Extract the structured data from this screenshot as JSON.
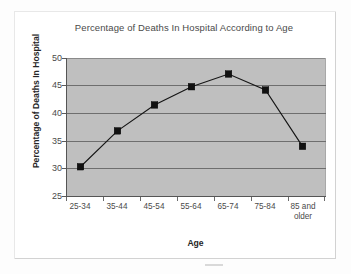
{
  "chart_data": {
    "type": "line",
    "title": "Percentage of Deaths In Hospital According to Age",
    "xlabel": "Age",
    "ylabel": "Percentage of Deaths In Hospital",
    "categories": [
      "25-34",
      "35-44",
      "45-54",
      "55-64",
      "65-74",
      "75-84",
      "85 and older"
    ],
    "values": [
      30.3,
      36.8,
      41.5,
      44.8,
      47.1,
      44.2,
      34.0
    ],
    "series": [
      {
        "name": "Percentage of Deaths In Hospital",
        "values": [
          30.3,
          36.8,
          41.5,
          44.8,
          47.1,
          44.2,
          34.0
        ]
      }
    ],
    "ylim": [
      25,
      50
    ],
    "yticks": [
      50,
      45,
      40,
      35,
      30,
      25
    ],
    "ytick_labels": [
      "50",
      "45",
      "40",
      "35",
      "30",
      "25"
    ],
    "grid": true,
    "grid_axis": "y",
    "legend": false,
    "legend_position": "none",
    "marker": "square",
    "marker_color": "#111111",
    "line_color": "#151515",
    "plot_background": "#bfbfbf",
    "figure_background": "#ffffff"
  },
  "labels": {
    "category_lines": [
      [
        "25-34"
      ],
      [
        "35-44"
      ],
      [
        "45-54"
      ],
      [
        "55-64"
      ],
      [
        "65-74"
      ],
      [
        "75-84"
      ],
      [
        "85 and",
        "older"
      ]
    ]
  }
}
